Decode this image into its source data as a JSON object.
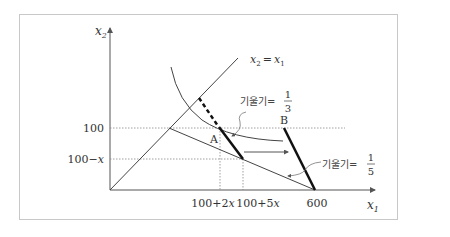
{
  "figure": {
    "y_axis_label": "x",
    "y_axis_sub": "2",
    "x_axis_label": "x",
    "x_axis_sub": "1",
    "diagonal_label_a": "x",
    "diagonal_sub_a": "2",
    "diagonal_eq": "=",
    "diagonal_label_b": "x",
    "diagonal_sub_b": "1",
    "y_tick_100": "100",
    "y_tick_100mx_num": "100−",
    "y_tick_100mx_var": "x",
    "x_tick_a_num": "100+2",
    "x_tick_a_var": "x",
    "x_tick_b_num": "100+5",
    "x_tick_b_var": "x",
    "x_tick_600": "600",
    "point_a": "A",
    "point_b": "B",
    "slope_label_1": "기울기=",
    "slope_1_num": "1",
    "slope_1_den": "3",
    "slope_label_2": "기울기=",
    "slope_2_num": "1",
    "slope_2_den": "5"
  },
  "colors": {
    "frame": "#c8c8c8",
    "axis": "#555555",
    "line": "#444444",
    "thick": "#111111",
    "dotted": "#888888"
  }
}
